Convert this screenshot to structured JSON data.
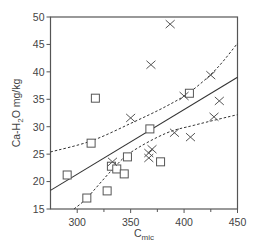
{
  "chart_data": {
    "type": "scatter",
    "title": "",
    "xlabel": "C_mic",
    "xlabel_main": "C",
    "xlabel_sub": "mic",
    "ylabel": "Ca-H2O mg/kg",
    "ylabel_parts": {
      "a": "Ca-H",
      "sub": "2",
      "b": "O mg/kg"
    },
    "xlim": [
      275,
      450
    ],
    "ylim": [
      15,
      50
    ],
    "x_ticks": [
      300,
      350,
      400,
      450
    ],
    "x_minor_ticks": [
      325,
      375,
      425
    ],
    "y_ticks": [
      15,
      20,
      25,
      30,
      35,
      40,
      45,
      50
    ],
    "grid": false,
    "legend": null,
    "series": [
      {
        "name": "squares",
        "marker": "square",
        "points": [
          [
            290.6,
            21.2
          ],
          [
            309,
            17.0
          ],
          [
            313,
            27.0
          ],
          [
            317,
            35.2
          ],
          [
            328,
            18.3
          ],
          [
            332,
            22.8
          ],
          [
            337,
            22.3
          ],
          [
            344,
            21.4
          ],
          [
            347,
            24.5
          ],
          [
            368,
            29.6
          ],
          [
            378,
            23.6
          ],
          [
            405,
            36.1
          ]
        ]
      },
      {
        "name": "crosses",
        "marker": "x",
        "points": [
          [
            333,
            23.6
          ],
          [
            350,
            31.6
          ],
          [
            367,
            25.2
          ],
          [
            367,
            24.3
          ],
          [
            369,
            41.3
          ],
          [
            370,
            25.9
          ],
          [
            387,
            48.7
          ],
          [
            391,
            28.9
          ],
          [
            400,
            35.6
          ],
          [
            406,
            28.1
          ],
          [
            425,
            39.4
          ],
          [
            428,
            31.8
          ],
          [
            433,
            34.7
          ]
        ]
      }
    ],
    "lines": [
      {
        "name": "regression",
        "style": "solid",
        "points": [
          [
            275,
            18.4
          ],
          [
            450,
            39.0
          ]
        ]
      },
      {
        "name": "upper-confidence",
        "style": "dashed",
        "points": [
          [
            275,
            25.4
          ],
          [
            313,
            27.4
          ],
          [
            350,
            30.6
          ],
          [
            383,
            33.7
          ],
          [
            406,
            36.4
          ],
          [
            430,
            40.5
          ],
          [
            450,
            45.2
          ]
        ]
      },
      {
        "name": "lower-confidence",
        "style": "dashed",
        "points": [
          [
            297,
            15.0
          ],
          [
            309,
            17.0
          ],
          [
            332,
            22.0
          ],
          [
            350,
            25.3
          ],
          [
            383,
            28.8
          ],
          [
            410,
            30.3
          ],
          [
            450,
            32.2
          ]
        ]
      }
    ]
  },
  "colors": {
    "axis": "#555555",
    "marker": "#555555",
    "text": "#444444"
  }
}
